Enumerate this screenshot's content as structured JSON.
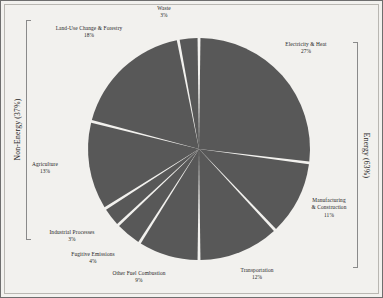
{
  "chart_data": {
    "type": "pie",
    "title": "",
    "subtitle": "",
    "xlabel": "",
    "ylabel": "",
    "legend_position": "none",
    "grid": false,
    "units": "percent",
    "start_angle_deg": 0,
    "direction": "clockwise",
    "slice_color": "#585858",
    "gap_color": "#f2f1ee",
    "categories": [
      "Electricity & Heat",
      "Manufacturing & Construction",
      "Transportation",
      "Other Fuel Combustion",
      "Fugitive Emissions",
      "Industrial Processes",
      "Agriculture",
      "Land-Use Change & Forestry",
      "Waste"
    ],
    "values": [
      27,
      11,
      12,
      9,
      4,
      3,
      13,
      18,
      3
    ],
    "slices": [
      {
        "label": "Electricity & Heat",
        "value": 27,
        "pct_text": "27%",
        "group": "Energy"
      },
      {
        "label": "Manufacturing\n& Construction",
        "value": 11,
        "pct_text": "11%",
        "group": "Energy"
      },
      {
        "label": "Transportation",
        "value": 12,
        "pct_text": "12%",
        "group": "Energy"
      },
      {
        "label": "Other Fuel Combustion",
        "value": 9,
        "pct_text": "9%",
        "group": "Energy"
      },
      {
        "label": "Fugitive Emissions",
        "value": 4,
        "pct_text": "4%",
        "group": "Energy"
      },
      {
        "label": "Industrial Processes",
        "value": 3,
        "pct_text": "3%",
        "group": "Non-Energy"
      },
      {
        "label": "Agriculture",
        "value": 13,
        "pct_text": "13%",
        "group": "Non-Energy"
      },
      {
        "label": "Land-Use Change & Forestry",
        "value": 18,
        "pct_text": "18%",
        "group": "Non-Energy"
      },
      {
        "label": "Waste",
        "value": 3,
        "pct_text": "3%",
        "group": "Non-Energy"
      }
    ],
    "groups": [
      {
        "name": "Energy",
        "value": 63,
        "label_text": "Energy (63%)",
        "side": "right"
      },
      {
        "name": "Non-Energy",
        "value": 37,
        "label_text": "Non-Energy (37%)",
        "side": "left"
      }
    ]
  },
  "labels": {
    "electricity_heat": {
      "name": "Electricity & Heat",
      "pct": "27%"
    },
    "manufacturing_line1": "Manufacturing",
    "manufacturing_line2": "& Construction",
    "manufacturing_pct": "11%",
    "transportation": {
      "name": "Transportation",
      "pct": "12%"
    },
    "other_fuel": {
      "name": "Other Fuel Combustion",
      "pct": "9%"
    },
    "fugitive": {
      "name": "Fugitive Emissions",
      "pct": "4%"
    },
    "industrial": {
      "name": "Industrial Processes",
      "pct": "3%"
    },
    "agriculture": {
      "name": "Agriculture",
      "pct": "13%"
    },
    "landuse": {
      "name": "Land-Use Change & Forestry",
      "pct": "18%"
    },
    "waste": {
      "name": "Waste",
      "pct": "3%"
    }
  },
  "groups": {
    "energy": "Energy (63%)",
    "non_energy": "Non-Energy (37%)"
  }
}
